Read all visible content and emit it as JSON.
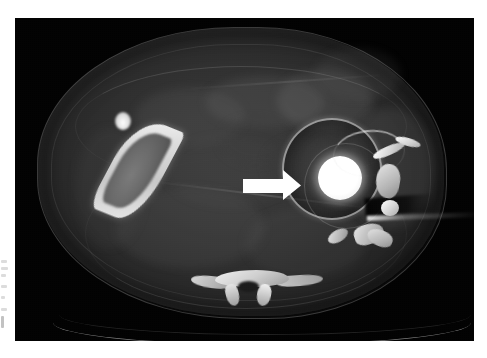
{
  "figure": {
    "type": "medical-image",
    "modality": "CT",
    "plane": "axial",
    "region": "pelvis / hip",
    "page_background": "#ffffff",
    "panel_background": "#010101"
  },
  "panel": {
    "x": 15,
    "y": 18,
    "width": 459,
    "height": 323
  },
  "annotation": {
    "arrow": {
      "color": "#ffffff",
      "direction": "right",
      "shaft": {
        "x": 243,
        "y": 179,
        "width": 41,
        "height": 14
      },
      "head": {
        "tip_x": 302,
        "base_x": 283,
        "top_y": 170,
        "bottom_y": 201
      },
      "points_to": "prosthetic-femoral-head"
    }
  },
  "features": {
    "prosthetic_head": {
      "center_x": 340,
      "center_y": 178,
      "radius": 22,
      "color": "#ffffff"
    },
    "capsule_ring": {
      "center_x": 330,
      "center_y": 167,
      "radius_x": 48,
      "radius_y": 49,
      "color": "#e6e6e6"
    },
    "femoral_shaft": {
      "x": 86,
      "y": 94,
      "width": 96,
      "height": 120,
      "color": "#f2f2f2"
    },
    "sacrum": {
      "x": 176,
      "y": 252,
      "width": 132,
      "height": 36,
      "color": "#efefef"
    },
    "couch_line": {
      "x": 38,
      "y": 282,
      "width": 418,
      "color": "#cdcdcd"
    },
    "streak_artifact": {
      "x": 352,
      "y": 196,
      "width": 108,
      "color": "#ffffff"
    }
  },
  "margin_marks": {
    "visible": true,
    "description": "faint cropped marginal marks at far-left page edge",
    "count": 7
  }
}
